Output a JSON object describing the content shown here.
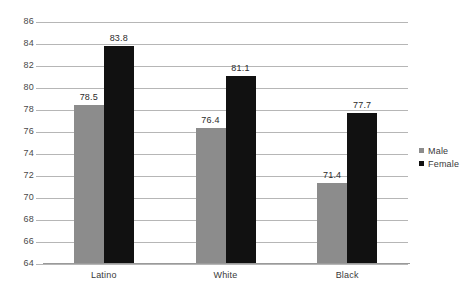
{
  "chart_data": {
    "type": "bar",
    "title": "",
    "subtitle": "",
    "xlabel": "",
    "ylabel": "",
    "categories": [
      "Latino",
      "White",
      "Black"
    ],
    "series": [
      {
        "name": "Male",
        "color": "#8c8c8c",
        "values": [
          78.5,
          76.4,
          71.4
        ]
      },
      {
        "name": "Female",
        "color": "#111111",
        "values": [
          83.8,
          81.1,
          77.7
        ]
      }
    ],
    "ylim": [
      64,
      86
    ],
    "ytick_step": 2,
    "yticks": [
      86,
      84,
      82,
      80,
      78,
      76,
      74,
      72,
      70,
      68,
      66,
      64
    ],
    "ytick_labels": [
      "86",
      "84",
      "82",
      "80",
      "78",
      "76",
      "74",
      "72",
      "70",
      "68",
      "66",
      "64"
    ],
    "data_labels": [
      [
        "78.5",
        "76.4",
        "71.4"
      ],
      [
        "83.8",
        "81.1",
        "77.7"
      ]
    ],
    "grid": true,
    "grid_axis": "y",
    "legend_position": "right",
    "legend": [
      "Male",
      "Female"
    ]
  },
  "legend": {
    "items": [
      {
        "label": "Male",
        "swatch": "male-swatch-icon"
      },
      {
        "label": "Female",
        "swatch": "female-swatch-icon"
      }
    ]
  }
}
